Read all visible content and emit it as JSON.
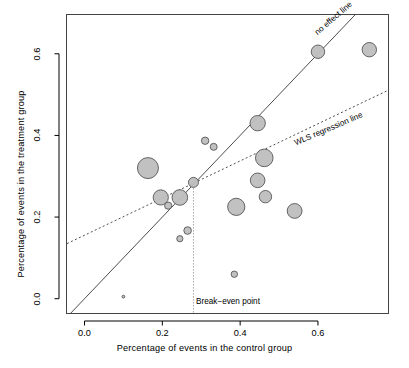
{
  "chart_data": {
    "type": "scatter",
    "title": "",
    "xlabel": "Percentage of events in the control group",
    "ylabel": "Percentage of events in the treatment group",
    "xlim": [
      -0.045,
      0.78
    ],
    "ylim": [
      -0.035,
      0.695
    ],
    "xticks": [
      0.0,
      0.2,
      0.4,
      0.6
    ],
    "xtick_labels": [
      "0.0",
      "0.2",
      "0.4",
      "0.6"
    ],
    "yticks": [
      0.0,
      0.2,
      0.4,
      0.6
    ],
    "ytick_labels": [
      "0.0",
      "0.2",
      "0.4",
      "0.6"
    ],
    "grid": false,
    "legend": "none",
    "marker_fill": "#BEBEBE",
    "marker_stroke": "#555555",
    "points": [
      {
        "x": 0.1,
        "y": 0.005,
        "size": 1.4
      },
      {
        "x": 0.163,
        "y": 0.32,
        "size": 10.5
      },
      {
        "x": 0.196,
        "y": 0.248,
        "size": 7.6
      },
      {
        "x": 0.215,
        "y": 0.228,
        "size": 3.6
      },
      {
        "x": 0.245,
        "y": 0.248,
        "size": 7.8
      },
      {
        "x": 0.245,
        "y": 0.147,
        "size": 3.1
      },
      {
        "x": 0.265,
        "y": 0.167,
        "size": 3.8
      },
      {
        "x": 0.28,
        "y": 0.285,
        "size": 5.0
      },
      {
        "x": 0.31,
        "y": 0.387,
        "size": 3.7
      },
      {
        "x": 0.332,
        "y": 0.372,
        "size": 3.5
      },
      {
        "x": 0.385,
        "y": 0.06,
        "size": 3.2
      },
      {
        "x": 0.39,
        "y": 0.225,
        "size": 8.6
      },
      {
        "x": 0.445,
        "y": 0.43,
        "size": 7.7
      },
      {
        "x": 0.445,
        "y": 0.29,
        "size": 7.3
      },
      {
        "x": 0.462,
        "y": 0.345,
        "size": 8.8
      },
      {
        "x": 0.465,
        "y": 0.25,
        "size": 6.2
      },
      {
        "x": 0.54,
        "y": 0.215,
        "size": 7.4
      },
      {
        "x": 0.6,
        "y": 0.605,
        "size": 6.7
      },
      {
        "x": 0.732,
        "y": 0.61,
        "size": 7.2
      }
    ],
    "lines": [
      {
        "name": "no effect line",
        "label": "no effect line",
        "style": "solid",
        "slope": 1.0,
        "intercept": 0.0,
        "color": "#4d4d4d"
      },
      {
        "name": "WLS regression line",
        "label": "WLS regression line",
        "style": "dashed",
        "slope": 0.455,
        "intercept": 0.1555,
        "color": "#4d4d4d"
      }
    ],
    "annotations": [
      {
        "name": "break-even-point",
        "label": "Break−even point",
        "x": 0.28,
        "y": 0.285,
        "marker_style": "dotted-vertical-line"
      }
    ]
  }
}
